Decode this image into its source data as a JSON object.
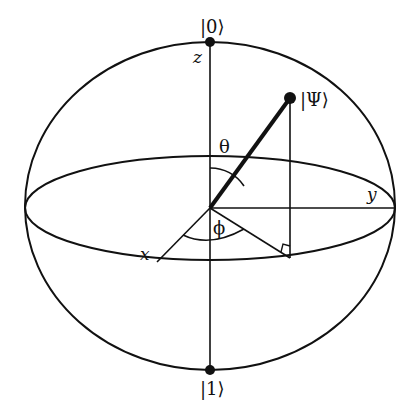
{
  "labels": {
    "ket0": "|0⟩",
    "ket1": "|1⟩",
    "psi": "|Ψ⟩",
    "z_axis": "z",
    "x_axis": "x",
    "y_axis": "y",
    "theta": "θ",
    "phi": "ϕ"
  },
  "colors": {
    "stroke": "#111111",
    "background": "#ffffff"
  }
}
